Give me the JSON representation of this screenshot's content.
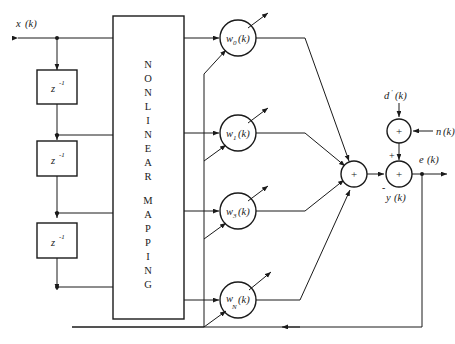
{
  "diagram": {
    "background_color": "#ffffff",
    "line_color": "#1a1a1a",
    "width": 455,
    "height": 344
  },
  "signals": {
    "input_label": "x",
    "input_arg": "(k)",
    "desired_label": "d",
    "desired_prime": "′",
    "desired_arg": "(k)",
    "noise_label": "n",
    "noise_arg": "(k)",
    "error_label": "e",
    "error_arg": "(k)",
    "output_label": "y",
    "output_arg": "(k)"
  },
  "delay_blocks": [
    {
      "name": "delay-1",
      "base": "z",
      "exponent": "-1"
    },
    {
      "name": "delay-2",
      "base": "z",
      "exponent": "-1"
    },
    {
      "name": "delay-3",
      "base": "z",
      "exponent": "-1"
    }
  ],
  "mapping_block": {
    "line1": "NONLINEAR",
    "line2": "MAPPING",
    "letters_line1": [
      "N",
      "O",
      "N",
      "L",
      "I",
      "N",
      "E",
      "A",
      "R"
    ],
    "letters_line2": [
      "M",
      "A",
      "P",
      "P",
      "I",
      "N",
      "G"
    ]
  },
  "weights": [
    {
      "name": "weight-0",
      "base": "w",
      "subscript": "0",
      "arg": "(k)"
    },
    {
      "name": "weight-1",
      "base": "w",
      "subscript": "1",
      "arg": "(k)"
    },
    {
      "name": "weight-3",
      "base": "w",
      "subscript": "3",
      "arg": "(k)"
    },
    {
      "name": "weight-N",
      "base": "w",
      "subscript": "N",
      "arg": "(k)"
    }
  ],
  "summing_junctions": [
    {
      "name": "output-sum",
      "sign": "+"
    },
    {
      "name": "noise-sum",
      "sign": "+"
    },
    {
      "name": "error-sum",
      "sign_positive": "+",
      "sign_negative": "-",
      "sign_center": "+"
    }
  ]
}
